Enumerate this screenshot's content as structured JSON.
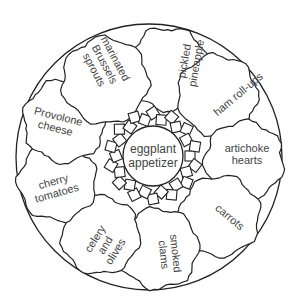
{
  "diagram": {
    "center": {
      "label_lines": [
        "eggplant",
        "appetizer"
      ]
    },
    "sections": [
      {
        "id": "pickled-pineapple",
        "label_lines": [
          "pickled",
          "pineapple"
        ]
      },
      {
        "id": "ham-roll-ups",
        "label_lines": [
          "ham roll-ups"
        ]
      },
      {
        "id": "artichoke-hearts",
        "label_lines": [
          "artichoke",
          "hearts"
        ]
      },
      {
        "id": "carrots",
        "label_lines": [
          "carrots"
        ]
      },
      {
        "id": "smoked-clams",
        "label_lines": [
          "smoked",
          "clams"
        ]
      },
      {
        "id": "celery-and-olives",
        "label_lines": [
          "celery",
          "and",
          "olives"
        ]
      },
      {
        "id": "cherry-tomatoes",
        "label_lines": [
          "cherry",
          "tomatoes"
        ]
      },
      {
        "id": "provolone-cheese",
        "label_lines": [
          "Provolone",
          "cheese"
        ]
      },
      {
        "id": "marinated-brussels-sprouts",
        "label_lines": [
          "marinated",
          "Brussels",
          "sprouts"
        ]
      }
    ]
  }
}
